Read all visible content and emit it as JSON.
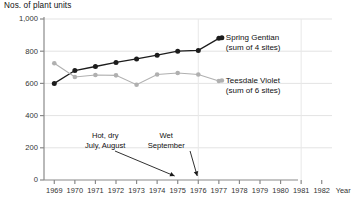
{
  "chart_data": {
    "type": "line",
    "title": "",
    "ylabel": "Nos. of plant units",
    "xlabel": "Year",
    "grid": true,
    "legend_position": "inline-right",
    "xlim": [
      1968.5,
      1982.5
    ],
    "ylim": [
      0,
      1000
    ],
    "yticks": [
      "0",
      "200",
      "400",
      "600",
      "800",
      "1,000"
    ],
    "ytick_values": [
      0,
      200,
      400,
      600,
      800,
      1000
    ],
    "xticks": [
      "1969",
      "1970",
      "1971",
      "1972",
      "1973",
      "1974",
      "1975",
      "1976",
      "1977",
      "1978",
      "1979",
      "1980",
      "1981",
      "1982"
    ],
    "x": [
      1969,
      1970,
      1971,
      1972,
      1973,
      1974,
      1975,
      1976,
      1977
    ],
    "series": [
      {
        "name": "Spring Gentian",
        "sublabel": "(sum of 4 sites)",
        "color": "#1c1c1c",
        "values": [
          600,
          680,
          705,
          730,
          752,
          775,
          800,
          805,
          880
        ]
      },
      {
        "name": "Teesdale Violet",
        "sublabel": "(sum of 6 sites)",
        "color": "#b0b0b0",
        "values": [
          725,
          640,
          652,
          650,
          592,
          655,
          665,
          655,
          615
        ]
      }
    ],
    "annotations": [
      {
        "text_line1": "Hot, dry",
        "text_line2": "July, August",
        "points_to_year": 1975
      },
      {
        "text_line1": "Wet",
        "text_line2": "September",
        "points_to_year": 1976
      }
    ]
  }
}
